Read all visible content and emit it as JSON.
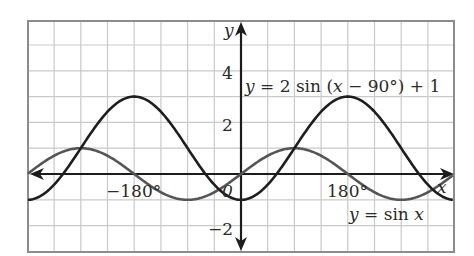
{
  "chart_data": {
    "type": "line",
    "title": "",
    "xlabel": "x",
    "ylabel": "y",
    "x_unit": "degrees",
    "xlim": [
      -405,
      360
    ],
    "ylim": [
      -3.0,
      5.9
    ],
    "grid": true,
    "grid_step_x": 45,
    "grid_step_y": 1,
    "x_tick_labels": [
      {
        "value": -180,
        "label": "−180°"
      },
      {
        "value": 0,
        "label": "0"
      },
      {
        "value": 180,
        "label": "180°"
      }
    ],
    "y_tick_labels": [
      {
        "value": 4,
        "label": "4"
      },
      {
        "value": 2,
        "label": "2"
      },
      {
        "value": -2,
        "label": "−2"
      }
    ],
    "series": [
      {
        "name": "y = sin x",
        "expression": "sin(x)",
        "color": "#555555",
        "x": [
          -405,
          -360,
          -315,
          -270,
          -225,
          -180,
          -135,
          -90,
          -45,
          0,
          45,
          90,
          135,
          180,
          225,
          270,
          315,
          360
        ],
        "values": [
          -0.71,
          0,
          0.71,
          1,
          0.71,
          0,
          -0.71,
          -1,
          -0.71,
          0,
          0.71,
          1,
          0.71,
          0,
          -0.71,
          -1,
          -0.71,
          0
        ]
      },
      {
        "name": "y = 2 sin (x − 90°) + 1",
        "expression": "2*sin(x-90)+1",
        "color": "#1e1e1e",
        "x": [
          -405,
          -360,
          -315,
          -270,
          -225,
          -180,
          -135,
          -90,
          -45,
          0,
          45,
          90,
          135,
          180,
          225,
          270,
          315,
          360
        ],
        "values": [
          -0.41,
          -1,
          -0.41,
          1,
          2.41,
          3,
          2.41,
          1,
          -0.41,
          -1,
          -0.41,
          1,
          2.41,
          3,
          2.41,
          1,
          -0.41,
          -1
        ]
      }
    ],
    "annotations": [
      {
        "text": "y = 2 sin (x − 90°) + 1",
        "near": "upper right, y≈3.6"
      },
      {
        "text": "y = sin x",
        "near": "lower right, y≈−1.6"
      }
    ],
    "legend": null
  },
  "labels": {
    "y_axis": "y",
    "x_axis": "x",
    "tick_neg180": "−180°",
    "tick_0": "0",
    "tick_180": "180°",
    "tick_y4": "4",
    "tick_y2": "2",
    "tick_yneg2": "−2",
    "curve2_label_y": "y",
    "curve2_label_rest": " = 2 sin (",
    "curve2_label_x": "x",
    "curve2_label_end": " − 90°) + 1",
    "curve1_label_y": "y",
    "curve1_label_mid": " = sin ",
    "curve1_label_x": "x"
  }
}
